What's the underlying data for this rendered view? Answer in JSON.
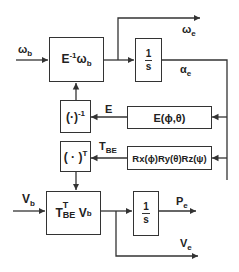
{
  "diagram": {
    "type": "block-diagram",
    "blocks": {
      "inverse_e_block": {
        "base": "E",
        "sup": "-1",
        "after": "ω",
        "after_sub": "b"
      },
      "integrator_top": {
        "num": "1",
        "den": "s"
      },
      "inverse_op": {
        "base": "(·)",
        "sup": "-1"
      },
      "e_matrix": {
        "text": "E(ϕ,θ)"
      },
      "transpose_op": {
        "base": "( · )",
        "sup": "T"
      },
      "rotation": {
        "text": "Rx(ϕ)Ry(θ)Rz(ψ)"
      },
      "transform_block": {
        "base": "T",
        "sup": "T",
        "sub": "BE",
        "after": " V",
        "after_sub": "b"
      },
      "integrator_bottom": {
        "num": "1",
        "den": "s"
      }
    },
    "signals": {
      "omega_b": {
        "base": "ω",
        "sub": "b"
      },
      "omega_e": {
        "base": "ω",
        "sub": "e"
      },
      "alpha_e": {
        "base": "α",
        "sub": "e"
      },
      "e_signal": {
        "text": "E"
      },
      "t_be": {
        "base": "T",
        "sub": "BE"
      },
      "v_b": {
        "base": "V",
        "sub": "b"
      },
      "p_e": {
        "base": "P",
        "sub": "e"
      },
      "v_e": {
        "base": "V",
        "sub": "e"
      }
    }
  }
}
